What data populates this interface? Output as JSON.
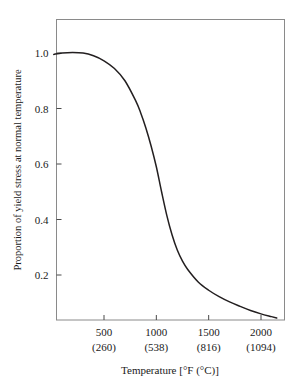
{
  "chart_data": {
    "type": "line",
    "title": "",
    "xlabel": "Temperature [°F (°C)]",
    "ylabel": "Proportion of yield stress at normal temperature",
    "xlim": [
      0,
      2200
    ],
    "ylim": [
      0,
      1.06
    ],
    "grid": false,
    "legend": null,
    "x_unit_primary": "°F",
    "x_unit_secondary": "°C",
    "x_ticks": [
      {
        "primary": "500",
        "secondary": "(260)",
        "value": 500
      },
      {
        "primary": "1000",
        "secondary": "(538)",
        "value": 1000
      },
      {
        "primary": "1500",
        "secondary": "(816)",
        "value": 1500
      },
      {
        "primary": "2000",
        "secondary": "(1094)",
        "value": 2000
      }
    ],
    "y_ticks": [
      {
        "label": "1.0",
        "value": 1.0
      },
      {
        "label": "0.8",
        "value": 0.8
      },
      {
        "label": "0.6",
        "value": 0.6
      },
      {
        "label": "0.4",
        "value": 0.4
      },
      {
        "label": "0.2",
        "value": 0.2
      }
    ],
    "series": [
      {
        "name": "yield stress proportion",
        "color": "#231f20",
        "x": [
          20,
          100,
          200,
          300,
          400,
          500,
          600,
          700,
          800,
          850,
          900,
          950,
          1000,
          1050,
          1100,
          1150,
          1200,
          1250,
          1300,
          1400,
          1500,
          1600,
          1700,
          1800,
          1900,
          2000,
          2100,
          2150
        ],
        "y": [
          0.995,
          1.0,
          1.002,
          1.0,
          0.99,
          0.972,
          0.944,
          0.9,
          0.83,
          0.785,
          0.73,
          0.665,
          0.59,
          0.5,
          0.415,
          0.345,
          0.29,
          0.25,
          0.22,
          0.175,
          0.145,
          0.122,
          0.103,
          0.087,
          0.072,
          0.06,
          0.05,
          0.045
        ]
      }
    ]
  },
  "colors": {
    "curve": "#231f20",
    "frame": "#808080",
    "text": "#1a1a1a",
    "background": "#ffffff"
  }
}
